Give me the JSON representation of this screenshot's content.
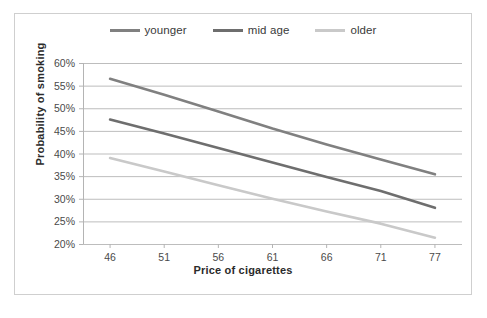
{
  "figure": {
    "border_color": "#cfcfcf",
    "background": "#ffffff"
  },
  "legend": {
    "position": "top-center",
    "items": [
      {
        "label": "younger",
        "color": "#808080"
      },
      {
        "label": "mid age",
        "color": "#6e6e6e"
      },
      {
        "label": "older",
        "color": "#c9c9c9"
      }
    ]
  },
  "axes": {
    "x_title": "Price of cigarettes",
    "y_title": "Probability of smoking",
    "x_ticks": [
      "46",
      "51",
      "56",
      "61",
      "66",
      "71",
      "77"
    ],
    "y_ticks": [
      "60%",
      "55%",
      "50%",
      "45%",
      "40%",
      "35%",
      "30%",
      "25%",
      "20%"
    ]
  },
  "chart_data": {
    "type": "line",
    "title": "",
    "xlabel": "Price of cigarettes",
    "ylabel": "Probability of smoking",
    "x": [
      46,
      51,
      56,
      61,
      66,
      71,
      77
    ],
    "xlim": [
      46,
      77
    ],
    "ylim": [
      20,
      60
    ],
    "y_unit": "percent",
    "grid": true,
    "grid_axis": "y",
    "legend": "top-center",
    "series": [
      {
        "name": "younger",
        "color": "#808080",
        "values": [
          56.5,
          53.0,
          49.3,
          45.5,
          42.0,
          38.7,
          35.4
        ]
      },
      {
        "name": "mid age",
        "color": "#6e6e6e",
        "values": [
          47.5,
          44.4,
          41.2,
          38.0,
          34.8,
          31.7,
          28.0
        ]
      },
      {
        "name": "older",
        "color": "#c9c9c9",
        "values": [
          39.0,
          36.0,
          33.0,
          30.0,
          27.2,
          24.5,
          21.4
        ]
      }
    ]
  }
}
